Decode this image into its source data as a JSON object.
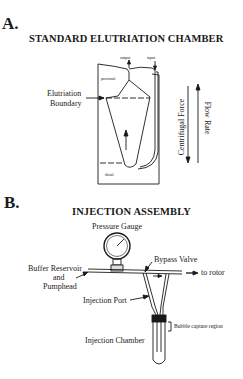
{
  "panel_a": {
    "letter": "A.",
    "title": "STANDARD ELUTRIATION CHAMBER",
    "labels": {
      "output": "output",
      "input": "input",
      "proximal": "proximal",
      "distal": "distal",
      "elutriation_boundary_1": "Elutriation",
      "elutriation_boundary_2": "Boundary",
      "centrifugal_force": "Centrifugal Force",
      "flow_rate": "Flow Rate"
    }
  },
  "panel_b": {
    "letter": "B.",
    "title": "INJECTION ASSEMBLY",
    "labels": {
      "pressure_gauge": "Pressure Gauge",
      "bypass_valve": "Bypass Valve",
      "buffer_reservoir_1": "Buffer Reservoir",
      "buffer_reservoir_2": "and",
      "buffer_reservoir_3": "Pumphead",
      "to_rotor": "to rotor",
      "injection_port": "Injection Port",
      "bubble_capture": "Bubble capture region",
      "injection_chamber": "Injection Chamber"
    }
  },
  "colors": {
    "ink": "#1a1a1a",
    "background": "#ffffff"
  }
}
